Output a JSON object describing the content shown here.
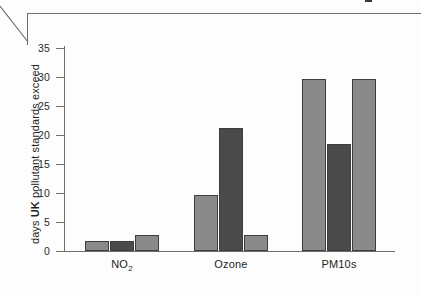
{
  "figure": {
    "frame_crumb": "text-fragment"
  },
  "chart_data": {
    "type": "bar",
    "title": "",
    "xlabel": "",
    "ylabel": "days UK pollutant standards exceed",
    "ylabel_parts": {
      "pre": "days ",
      "bold": "UK",
      "post": " pollutant standards exceed"
    },
    "categories": [
      "NO2",
      "Ozone",
      "PM10s"
    ],
    "category_labels": [
      {
        "text": "NO",
        "sub": "2"
      },
      {
        "text": "Ozone",
        "sub": ""
      },
      {
        "text": "PM10s",
        "sub": ""
      }
    ],
    "series": [
      {
        "name": "series-1",
        "color": "#8a8a8a",
        "values": [
          1.7,
          9.7,
          29.7
        ]
      },
      {
        "name": "series-2",
        "color": "#4a4a4a",
        "values": [
          1.7,
          21.2,
          18.5
        ]
      },
      {
        "name": "series-3",
        "color": "#8a8a8a",
        "values": [
          2.7,
          2.7,
          29.7
        ]
      }
    ],
    "ylim": [
      0,
      35
    ],
    "yticks": [
      0,
      5,
      10,
      15,
      20,
      25,
      30,
      35
    ],
    "ytick_labels": [
      "0",
      "5",
      "10",
      "15",
      "20",
      "25",
      "30",
      "35"
    ],
    "grid": false,
    "legend": "none",
    "colors": {
      "light_bar": "#8a8a8a",
      "dark_bar": "#4a4a4a",
      "bar_outline": "#3d3d3d",
      "axis": "#6e6e6e",
      "text": "#1d1d1d",
      "background": "#fdfdfd"
    }
  }
}
